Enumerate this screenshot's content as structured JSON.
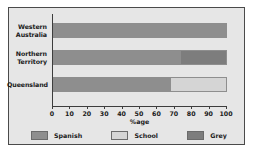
{
  "chart_data": {
    "type": "bar",
    "orientation": "horizontal",
    "stacked": true,
    "title": "",
    "xlabel": "%age",
    "ylabel": "",
    "categories": [
      "Western Australia",
      "Northern Territory",
      "Queensland"
    ],
    "series": [
      {
        "name": "Spanish",
        "color": "#8e8e8e",
        "values": [
          100,
          73,
          67
        ]
      },
      {
        "name": "School",
        "color": "#d5d5d5",
        "values": [
          0,
          0,
          33
        ]
      },
      {
        "name": "Grey",
        "color": "#7d7d7d",
        "values": [
          0,
          27,
          0
        ]
      }
    ],
    "xlim": [
      0,
      100
    ],
    "xticks": [
      0,
      10,
      20,
      30,
      40,
      50,
      60,
      70,
      80,
      90,
      100
    ],
    "grid": false,
    "legend_position": "bottom"
  },
  "axis": {
    "x_tick_labels": [
      "0",
      "10",
      "20",
      "30",
      "40",
      "50",
      "60",
      "70",
      "80",
      "90",
      "100"
    ],
    "x_axis_label": "%age",
    "y_tick_labels": [
      {
        "line1": "Western",
        "line2": "Australia"
      },
      {
        "line1": "Northern",
        "line2": "Territory"
      },
      {
        "line1": "Queensland",
        "line2": ""
      }
    ]
  },
  "legend": {
    "items": [
      {
        "label": "Spanish",
        "color": "#8e8e8e"
      },
      {
        "label": "School",
        "color": "#d5d5d5"
      },
      {
        "label": "Grey",
        "color": "#7d7d7d"
      }
    ]
  },
  "colors": {
    "figure_background": "#e6e6e6",
    "page_background": "#ffffff",
    "frame_border": "#4a4a4a",
    "axis": "#3d3d3d",
    "text": "#1a1a1a"
  }
}
